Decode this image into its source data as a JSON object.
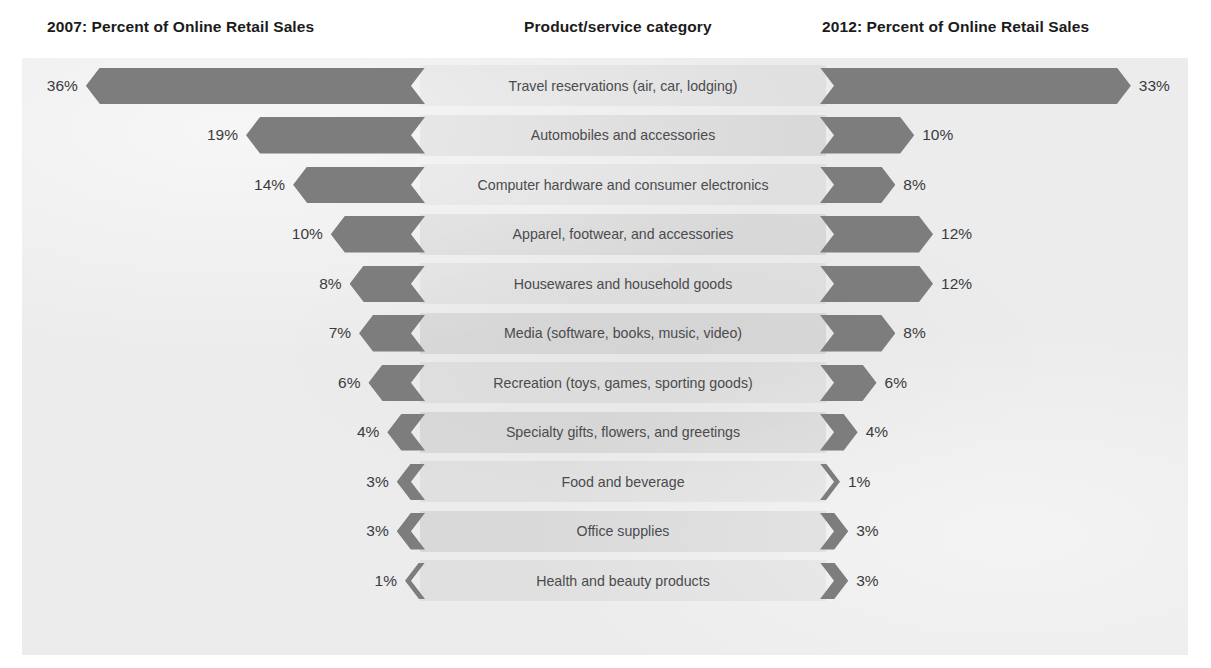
{
  "header": {
    "left_title": "2007: Percent of Online Retail Sales",
    "middle_title": "Product/service category",
    "right_title": "2012: Percent of Online Retail Sales"
  },
  "colors": {
    "bar": "#7d7d7e",
    "panel_background": "#ececed",
    "band": "#e0e0e1",
    "band_alt": "#d9d9da",
    "label_text": "#4b4b4d",
    "value_text": "#3b3b3d",
    "header_text": "#1b1b1b"
  },
  "chart_data": {
    "type": "bar",
    "subtype": "tornado",
    "title": "",
    "xlabel": "",
    "ylabel": "",
    "grid": false,
    "legend": "none",
    "axis_note": "Bars diverge from a central category column; left series grows leftward, right series grows rightward.",
    "unit": "%",
    "xlim": [
      0,
      36
    ],
    "categories": [
      "Travel reservations (air, car, lodging)",
      "Automobiles and accessories",
      "Computer hardware and consumer electronics",
      "Apparel, footwear, and accessories",
      "Housewares and household goods",
      "Media (software, books, music, video)",
      "Recreation (toys, games, sporting goods)",
      "Specialty gifts, flowers, and greetings",
      "Food and beverage",
      "Office supplies",
      "Health and beauty products"
    ],
    "series": [
      {
        "name": "2007: Percent of Online Retail Sales",
        "side": "left",
        "values": [
          36,
          19,
          14,
          10,
          8,
          7,
          6,
          4,
          3,
          3,
          1
        ],
        "labels": [
          "36%",
          "19%",
          "14%",
          "10%",
          "8%",
          "7%",
          "6%",
          "4%",
          "3%",
          "3%",
          "1%"
        ]
      },
      {
        "name": "2012: Percent of Online Retail Sales",
        "side": "right",
        "values": [
          33,
          10,
          8,
          12,
          12,
          8,
          6,
          4,
          1,
          3,
          3
        ],
        "labels": [
          "33%",
          "10%",
          "8%",
          "12%",
          "12%",
          "8%",
          "6%",
          "4%",
          "1%",
          "3%",
          "3%"
        ]
      }
    ]
  }
}
